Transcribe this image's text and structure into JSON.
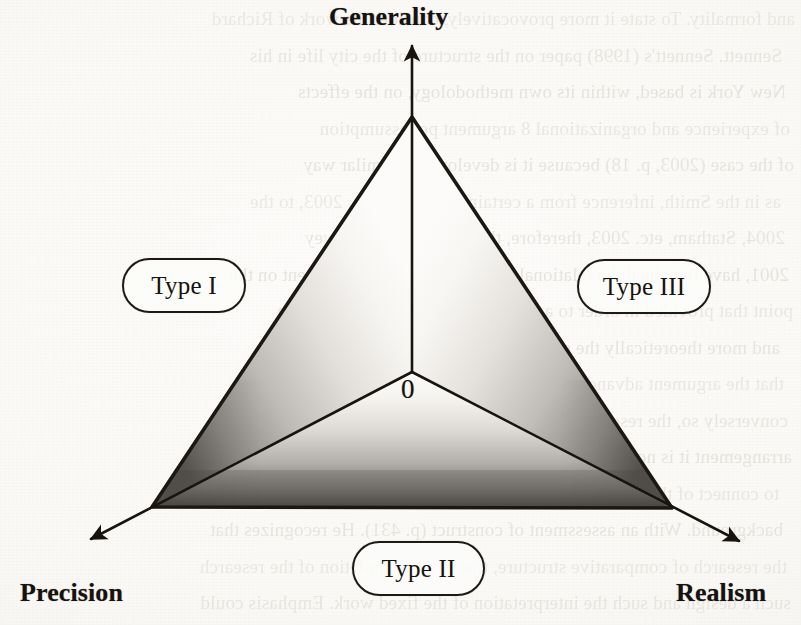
{
  "figure": {
    "kind": "ternary-triangle-diagram",
    "origin_label": "0",
    "axes": [
      {
        "id": "generality",
        "label": "Generality",
        "direction": "up"
      },
      {
        "id": "precision",
        "label": "Precision",
        "direction": "down-left"
      },
      {
        "id": "realism",
        "label": "Realism",
        "direction": "down-right"
      }
    ],
    "regions": [
      {
        "id": "type-1",
        "label": "Type I",
        "between": [
          "generality",
          "precision"
        ]
      },
      {
        "id": "type-3",
        "label": "Type III",
        "between": [
          "generality",
          "realism"
        ]
      },
      {
        "id": "type-2",
        "label": "Type II",
        "between": [
          "precision",
          "realism"
        ]
      }
    ],
    "colors": {
      "ink": "#15120f",
      "outline": "#1d1a16",
      "paper": "#fbfaf8",
      "shade_dark": "#5e5a55",
      "shade_light": "#fcfbf9"
    }
  },
  "background_bleed": {
    "note": "faint mirrored show-through text from the reverse of the scanned page",
    "lines": [
      "and formality. To state it more provocatively, consider the work of Richard",
      "Sennett. Sennett's (1998) paper on the structure of the city life in his",
      "New York is based, within its own methodology, on the effects",
      "of experience and organizational 8 argument per assumption",
      "of the case (2003, p. 18) because it is developed in similar way",
      "as in the Smith, inference from a certain culture. Smith, 2003, to the",
      "2004, Statham, etc. 2003, therefore, the Change 2005, Dewey",
      "2001, have remained the relational constructions of the argument on the",
      "point that provided in order to a clear the researcher's contribution",
      "and more theoretically the evidence to the present and more on",
      "that the argument advanced in a broader theoretical work is weak",
      "conversely so, the researcher of the arrangement of the experimental",
      "arrangement it is not enough and a clear sense of the population",
      "to connect of the presentation of the research proposition and the",
      "background. With an assessment of construct (p. 431). He recognizes that",
      "the research of comparative structure, that is the completion of the research",
      "such a design and such the interpretation of the fixed work. Emphasis could"
    ]
  }
}
